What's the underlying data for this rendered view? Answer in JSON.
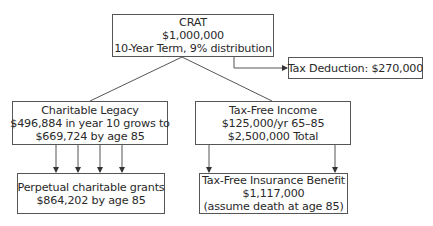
{
  "nodes": {
    "crat": {
      "lines": [
        "CRAT",
        "$1,000,000",
        "10-Year Term, 9% distribution"
      ]
    },
    "tax_deduction": {
      "lines": [
        "Tax Deduction: $270,000"
      ]
    },
    "charitable_legacy": {
      "lines": [
        "Charitable Legacy",
        "$496,884 in year 10 grows to",
        "$669,724 by age 85"
      ]
    },
    "tax_free_income": {
      "lines": [
        "Tax-Free Income",
        "$125,000/yr 65–85",
        "$2,500,000 Total"
      ]
    },
    "perpetual_grants": {
      "lines": [
        "Perpetual charitable grants",
        "$864,202 by age 85"
      ]
    },
    "insurance_benefit": {
      "lines": [
        "Tax-Free Insurance Benefit",
        "$1,117,000",
        "(assume death at age 85)"
      ]
    }
  },
  "edges": [
    {
      "from": "crat",
      "to": "charitable_legacy",
      "style": "line"
    },
    {
      "from": "crat",
      "to": "tax_free_income",
      "style": "line"
    },
    {
      "from": "crat",
      "to": "tax_deduction",
      "style": "elbow-arrow"
    },
    {
      "from": "charitable_legacy",
      "to": "perpetual_grants",
      "style": "arrow",
      "count": 4
    },
    {
      "from": "tax_free_income",
      "to": "insurance_benefit",
      "style": "arrow",
      "count": 2
    }
  ],
  "colors": {
    "stroke": "#555555",
    "text": "#2a2a2a",
    "background": "#ffffff"
  }
}
